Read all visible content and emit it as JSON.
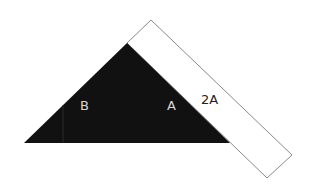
{
  "diagram": {
    "triangle": {
      "fill": "#111111",
      "points": [
        [
          24,
          143
        ],
        [
          127,
          43
        ],
        [
          230,
          143
        ]
      ]
    },
    "rectangle": {
      "fill": "#ffffff",
      "stroke": "#8a8a8a",
      "points": [
        [
          127,
          43
        ],
        [
          151,
          20
        ],
        [
          292,
          155
        ],
        [
          267,
          178
        ]
      ]
    },
    "labels": {
      "b": "B",
      "a": "A",
      "two_a": "2A"
    },
    "label_colors": {
      "on_dark": "#d8d8d8",
      "on_light": "#222222"
    }
  }
}
